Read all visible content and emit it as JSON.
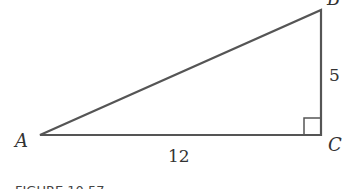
{
  "figure": {
    "caption": "FIGURE 10.57",
    "vertices": [
      {
        "label": "A",
        "x": 40,
        "y": 135
      },
      {
        "label": "B",
        "x": 321,
        "y": 10
      },
      {
        "label": "C",
        "x": 321,
        "y": 135
      }
    ],
    "sides": [
      {
        "between": "A-C",
        "label": "12"
      },
      {
        "between": "B-C",
        "label": "5"
      }
    ],
    "right_angle_at": "C",
    "stroke_color": "#555555"
  }
}
